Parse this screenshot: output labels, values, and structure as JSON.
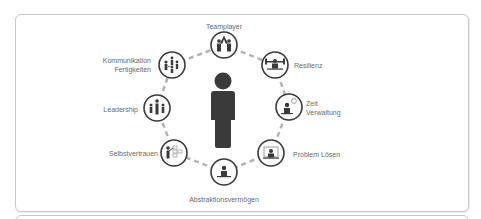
{
  "diagram": {
    "center_icon": "person-icon",
    "colors": {
      "icon": "#3a3a3a",
      "dash": "#b3b3b3",
      "label": "#6b6b6b",
      "border": "#c8c8c8"
    },
    "skills": [
      {
        "label": "Teamplayer",
        "icon": "handshake-team-icon"
      },
      {
        "label": "Resilienz",
        "icon": "weightlifter-icon"
      },
      {
        "label": "Zeit Verwaltung",
        "line1": "Zeit",
        "line2": "Verwaltung",
        "icon": "person-clock-icon"
      },
      {
        "label": "Problem Lösen",
        "icon": "person-laptop-icon"
      },
      {
        "label": "Abstraktionsvermögen",
        "icon": "person-desk-icon"
      },
      {
        "label": "Selbstvertrauen",
        "icon": "presenter-board-icon"
      },
      {
        "label": "Leadership",
        "icon": "leader-group-icon"
      },
      {
        "label": "Kommunikation Fertigkeiten",
        "line1": "Kommunikation",
        "line2": "Fertigkeiten",
        "icon": "communication-group-icon"
      }
    ]
  }
}
